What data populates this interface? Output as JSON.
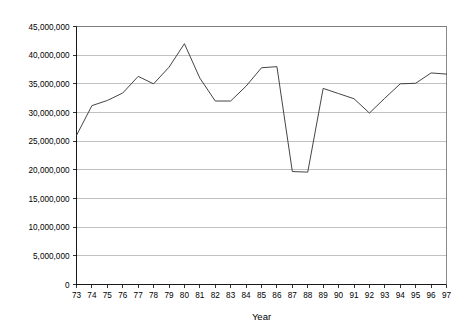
{
  "chart_data": {
    "type": "line",
    "title": "",
    "subtitle": "",
    "xlabel": "Year",
    "ylabel": "",
    "grid": true,
    "legend": false,
    "legend_position": "none",
    "xlim": [
      73,
      97
    ],
    "ylim": [
      0,
      45000000
    ],
    "ytick_step": 5000000,
    "categories": [
      "73",
      "74",
      "75",
      "76",
      "77",
      "78",
      "79",
      "80",
      "81",
      "82",
      "83",
      "84",
      "85",
      "86",
      "87",
      "88",
      "89",
      "90",
      "91",
      "92",
      "93",
      "94",
      "95",
      "96",
      "97"
    ],
    "x": [
      73,
      74,
      75,
      76,
      77,
      78,
      79,
      80,
      81,
      82,
      83,
      84,
      85,
      86,
      87,
      88,
      89,
      90,
      91,
      92,
      93,
      94,
      95,
      96,
      97
    ],
    "values": [
      26000000,
      31200000,
      32100000,
      33400000,
      36300000,
      35000000,
      37900000,
      42000000,
      36000000,
      32000000,
      32000000,
      34600000,
      37800000,
      38000000,
      19700000,
      19600000,
      34200000,
      33300000,
      32400000,
      29900000,
      32500000,
      35000000,
      35100000,
      36900000,
      36700000
    ],
    "series": [
      {
        "name": "series-1",
        "values": [
          26000000,
          31200000,
          32100000,
          33400000,
          36300000,
          35000000,
          37900000,
          42000000,
          36000000,
          32000000,
          32000000,
          34600000,
          37800000,
          38000000,
          19700000,
          19600000,
          34200000,
          33300000,
          32400000,
          29900000,
          32500000,
          35000000,
          35100000,
          36900000,
          36700000
        ]
      }
    ],
    "ytick_labels": [
      "0",
      "5,000,000",
      "10,000,000",
      "15,000,000",
      "20,000,000",
      "25,000,000",
      "30,000,000",
      "35,000,000",
      "40,000,000",
      "45,000,000"
    ],
    "xtick_labels": [
      "73",
      "74",
      "75",
      "76",
      "77",
      "78",
      "79",
      "80",
      "81",
      "82",
      "83",
      "84",
      "85",
      "86",
      "87",
      "88",
      "89",
      "90",
      "91",
      "92",
      "93",
      "94",
      "95",
      "96",
      "97"
    ],
    "colors": {
      "line": "#3b3b3b",
      "grid": "#a6a6a6",
      "axis": "#000000",
      "background": "#ffffff"
    }
  }
}
